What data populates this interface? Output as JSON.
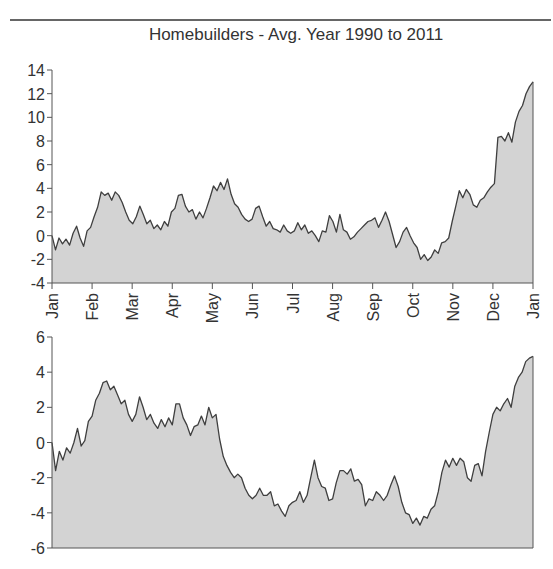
{
  "chart_data": [
    {
      "type": "area",
      "title": "Homebuilders - Avg. Year 1990 to 2011",
      "xlabel": "",
      "ylabel": "",
      "ylim": [
        -4,
        14
      ],
      "yticks": [
        14,
        12,
        10,
        8,
        6,
        4,
        2,
        0,
        -2,
        -4
      ],
      "categories": [
        "Jan",
        "Feb",
        "Mar",
        "Apr",
        "May",
        "Jun",
        "Jul",
        "Aug",
        "Sep",
        "Oct",
        "Nov",
        "Dec",
        "Jan"
      ],
      "grid": false,
      "legend": "none",
      "series": [
        {
          "name": "Top panel average",
          "values": [
            0.0,
            -1.2,
            -0.2,
            -0.7,
            -0.3,
            -0.8,
            0.2,
            0.8,
            -0.2,
            -0.9,
            0.4,
            0.7,
            1.6,
            2.4,
            3.7,
            3.4,
            3.6,
            3.0,
            3.7,
            3.4,
            2.8,
            2.0,
            1.3,
            1.0,
            1.6,
            2.5,
            1.8,
            1.0,
            1.3,
            0.6,
            0.9,
            0.5,
            1.2,
            0.8,
            2.0,
            2.3,
            3.4,
            3.5,
            2.5,
            2.0,
            2.2,
            1.4,
            2.0,
            1.5,
            2.3,
            3.2,
            4.2,
            3.8,
            4.5,
            3.9,
            4.8,
            3.5,
            2.7,
            2.4,
            1.8,
            1.4,
            1.2,
            1.4,
            2.3,
            2.5,
            1.6,
            0.8,
            1.2,
            0.6,
            0.5,
            0.3,
            0.9,
            0.4,
            0.2,
            0.4,
            1.1,
            0.5,
            0.9,
            0.2,
            0.4,
            0.0,
            -0.5,
            0.4,
            0.3,
            1.7,
            1.2,
            0.3,
            1.8,
            0.5,
            0.3,
            -0.3,
            -0.1,
            0.3,
            0.6,
            0.9,
            1.2,
            1.3,
            1.5,
            0.7,
            1.3,
            2.0,
            1.2,
            0.1,
            -1.0,
            -0.5,
            0.3,
            0.7,
            0.0,
            -0.6,
            -1.0,
            -2.0,
            -1.6,
            -2.1,
            -1.8,
            -1.2,
            -1.5,
            -0.6,
            -0.5,
            -0.2,
            1.2,
            2.5,
            3.8,
            3.2,
            3.9,
            3.5,
            2.6,
            2.4,
            3.0,
            3.2,
            3.7,
            4.1,
            4.4,
            8.3,
            8.4,
            8.0,
            8.7,
            7.9,
            9.6,
            10.5,
            11.0,
            12.0,
            12.6,
            13.0
          ]
        }
      ]
    },
    {
      "type": "area",
      "title": "",
      "xlabel": "",
      "ylabel": "",
      "ylim": [
        -6,
        6
      ],
      "yticks": [
        6,
        4,
        2,
        0,
        -2,
        -4,
        -6
      ],
      "categories": [
        "Jan",
        "Feb",
        "Mar",
        "Apr",
        "May",
        "Jun",
        "Jul",
        "Aug",
        "Sep",
        "Oct",
        "Nov",
        "Dec",
        "Jan"
      ],
      "grid": false,
      "legend": "none",
      "series": [
        {
          "name": "Bottom panel average",
          "values": [
            0.0,
            -1.6,
            -0.5,
            -1.0,
            -0.3,
            -0.6,
            0.0,
            0.8,
            -0.2,
            0.1,
            1.2,
            1.5,
            2.4,
            2.8,
            3.4,
            3.5,
            3.0,
            3.2,
            2.7,
            2.2,
            2.4,
            1.6,
            1.2,
            1.6,
            2.6,
            2.0,
            1.3,
            1.6,
            1.1,
            0.8,
            1.3,
            0.9,
            1.4,
            1.0,
            2.2,
            2.2,
            1.4,
            1.0,
            0.4,
            0.9,
            1.0,
            1.5,
            1.0,
            2.0,
            1.4,
            1.6,
            0.2,
            -0.8,
            -1.3,
            -1.7,
            -2.0,
            -1.8,
            -2.0,
            -2.6,
            -3.0,
            -3.2,
            -3.0,
            -2.6,
            -3.0,
            -3.0,
            -2.8,
            -3.6,
            -3.5,
            -3.9,
            -4.2,
            -3.6,
            -3.4,
            -3.3,
            -2.8,
            -3.4,
            -3.0,
            -2.0,
            -1.0,
            -2.0,
            -2.5,
            -2.6,
            -3.3,
            -3.2,
            -2.3,
            -1.6,
            -1.6,
            -1.8,
            -1.5,
            -2.2,
            -2.1,
            -2.4,
            -3.6,
            -3.2,
            -3.3,
            -2.8,
            -3.0,
            -3.3,
            -3.0,
            -2.4,
            -1.9,
            -2.5,
            -3.4,
            -4.0,
            -4.1,
            -4.6,
            -4.3,
            -4.7,
            -4.2,
            -4.3,
            -3.8,
            -3.6,
            -2.8,
            -1.7,
            -1.0,
            -1.4,
            -0.9,
            -1.3,
            -0.9,
            -1.1,
            -2.0,
            -2.2,
            -1.3,
            -1.2,
            -1.9,
            -0.5,
            0.6,
            1.6,
            2.0,
            1.8,
            2.2,
            2.5,
            2.0,
            3.2,
            3.7,
            4.0,
            4.6,
            4.8,
            4.9
          ]
        }
      ]
    }
  ],
  "ui": {
    "title": "Homebuilders - Avg. Year 1990 to 2011",
    "top_y_labels": [
      "14",
      "12",
      "10",
      "8",
      "6",
      "4",
      "2",
      "0",
      "-2",
      "-4"
    ],
    "bottom_y_labels": [
      "6",
      "4",
      "2",
      "0",
      "-2",
      "-4",
      "-6"
    ],
    "month_labels": [
      "Jan",
      "Feb",
      "Mar",
      "Apr",
      "May",
      "Jun",
      "Jul",
      "Aug",
      "Sep",
      "Oct",
      "Nov",
      "Dec",
      "Jan"
    ],
    "colors": {
      "fill": "#d3d3d3",
      "line": "#3f3f3f",
      "axis": "#555555",
      "rule": "#333333"
    }
  }
}
